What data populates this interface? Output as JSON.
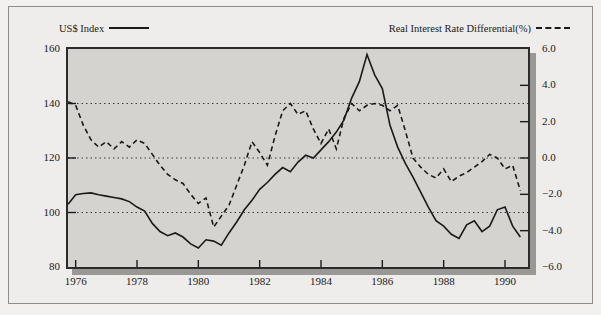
{
  "legend": {
    "left": {
      "label": "US$ Index",
      "style": "solid",
      "color": "#1a1a1a"
    },
    "right": {
      "label": "Real Interest Rate Differential(%)",
      "style": "dashed",
      "color": "#1a1a1a"
    }
  },
  "axes": {
    "left_ticks": [
      "160",
      "140",
      "120",
      "100",
      "80"
    ],
    "right_ticks": [
      "6.0",
      "4.0",
      "2.0",
      "0.0",
      "-2.0",
      "-4.0",
      "-6.0"
    ],
    "x_ticks": [
      "1976",
      "1978",
      "1980",
      "1982",
      "1984",
      "1986",
      "1988",
      "1990"
    ]
  },
  "chart_data": {
    "type": "line",
    "title": "",
    "xlabel": "",
    "ylabel": "US$ Index",
    "y2label": "Real Interest Rate Differential(%)",
    "xlim": [
      1975.75,
      1990.75
    ],
    "ylim": [
      80,
      160
    ],
    "y2lim": [
      -6.0,
      6.0
    ],
    "grid": true,
    "gridlines_left": [
      140,
      120,
      100
    ],
    "legend_position": "top",
    "x": [
      1975.75,
      1976.0,
      1976.25,
      1976.5,
      1976.75,
      1977.0,
      1977.25,
      1977.5,
      1977.75,
      1978.0,
      1978.25,
      1978.5,
      1978.75,
      1979.0,
      1979.25,
      1979.5,
      1979.75,
      1980.0,
      1980.25,
      1980.5,
      1980.75,
      1981.0,
      1981.25,
      1981.5,
      1981.75,
      1982.0,
      1982.25,
      1982.5,
      1982.75,
      1983.0,
      1983.25,
      1983.5,
      1983.75,
      1984.0,
      1984.25,
      1984.5,
      1984.75,
      1985.0,
      1985.25,
      1985.5,
      1985.75,
      1986.0,
      1986.25,
      1986.5,
      1986.75,
      1987.0,
      1987.25,
      1987.5,
      1987.75,
      1988.0,
      1988.25,
      1988.5,
      1988.75,
      1989.0,
      1989.25,
      1989.5,
      1989.75,
      1990.0,
      1990.25,
      1990.5
    ],
    "series": [
      {
        "name": "US$ Index",
        "axis": "left",
        "style": "solid",
        "color": "#1a1a1a",
        "values": [
          103.0,
          106.5,
          107.0,
          107.2,
          106.5,
          106.0,
          105.5,
          105.0,
          104.0,
          102.0,
          100.5,
          96.0,
          93.0,
          91.5,
          92.5,
          91.0,
          88.5,
          87.0,
          90.0,
          89.5,
          88.0,
          92.5,
          96.5,
          101.0,
          104.5,
          108.5,
          111.0,
          114.0,
          116.5,
          115.0,
          118.5,
          121.0,
          120.0,
          123.0,
          126.0,
          129.5,
          134.0,
          142.0,
          148.0,
          158.0,
          150.5,
          145.5,
          132.0,
          124.0,
          118.0,
          113.0,
          107.5,
          102.0,
          97.0,
          95.0,
          92.0,
          90.5,
          95.5,
          97.0,
          93.0,
          95.0,
          101.0,
          102.0,
          95.0,
          91.0
        ]
      },
      {
        "name": "Real Interest Rate Differential(%)",
        "axis": "right",
        "style": "dashed",
        "color": "#1a1a1a",
        "values": [
          3.1,
          2.9,
          1.8,
          1.0,
          0.6,
          0.9,
          0.5,
          0.9,
          0.6,
          1.0,
          0.8,
          0.2,
          -0.4,
          -0.9,
          -1.2,
          -1.4,
          -2.0,
          -2.5,
          -2.2,
          -3.8,
          -3.2,
          -2.6,
          -1.5,
          -0.4,
          0.9,
          0.3,
          -0.4,
          1.2,
          2.6,
          3.0,
          2.4,
          2.6,
          1.6,
          0.8,
          1.6,
          0.5,
          2.2,
          3.0,
          2.6,
          2.9,
          3.0,
          2.9,
          2.6,
          2.9,
          1.5,
          0.0,
          -0.5,
          -0.9,
          -1.1,
          -0.6,
          -1.3,
          -1.0,
          -0.8,
          -0.5,
          -0.2,
          0.2,
          0.0,
          -0.6,
          -0.4,
          -1.8
        ]
      }
    ]
  }
}
